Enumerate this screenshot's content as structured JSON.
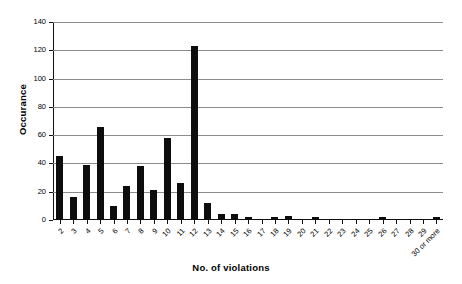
{
  "chart_data": {
    "type": "bar",
    "title": "",
    "xlabel": "No. of violations",
    "ylabel": "Occurance",
    "ylim": [
      0,
      140
    ],
    "ytick_step": 20,
    "yticks": [
      0,
      20,
      40,
      60,
      80,
      100,
      120,
      140
    ],
    "grid": true,
    "legend": null,
    "bar_color": "#0d0d0d",
    "categories": [
      "2",
      "3",
      "4",
      "5",
      "6",
      "7",
      "8",
      "9",
      "10",
      "11",
      "12",
      "13",
      "14",
      "15",
      "16",
      "17",
      "18",
      "19",
      "20",
      "21",
      "22",
      "23",
      "24",
      "25",
      "26",
      "27",
      "28",
      "29",
      "30 or more"
    ],
    "values": [
      45,
      16,
      39,
      66,
      10,
      24,
      38,
      21,
      58,
      26,
      123,
      12,
      4,
      4,
      2,
      1,
      2,
      3,
      1,
      2,
      1,
      0,
      1,
      1,
      2,
      0,
      0,
      0,
      2
    ]
  },
  "axes": {
    "y_title": "Occurance",
    "x_title": "No. of violations"
  }
}
